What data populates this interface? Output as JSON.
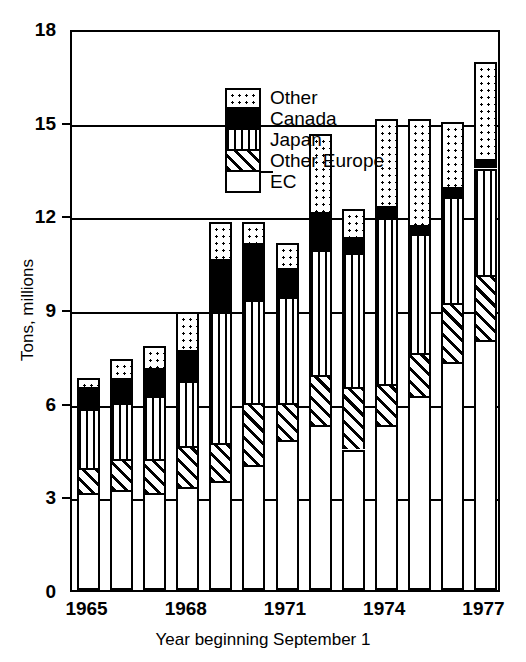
{
  "chart_data": {
    "type": "bar",
    "subtype": "stacked-bar",
    "title": "",
    "xlabel": "Year beginning September 1",
    "ylabel": "Tons, millions",
    "ylim": [
      0,
      18
    ],
    "yticks": [
      0,
      3,
      6,
      9,
      12,
      15,
      18
    ],
    "ytick_labels": [
      "0",
      "3",
      "6",
      "9",
      "12",
      "15",
      "18"
    ],
    "grid": true,
    "grid_axis": "y",
    "legend_position": "upper-left-inside",
    "categories": [
      1965,
      1966,
      1967,
      1968,
      1969,
      1970,
      1971,
      1972,
      1973,
      1974,
      1975,
      1976,
      1977
    ],
    "xtick_labels": [
      "1965",
      "1968",
      "1971",
      "1974",
      "1977"
    ],
    "xtick_categories": [
      1965,
      1968,
      1971,
      1974,
      1977
    ],
    "series": [
      {
        "name": "EC",
        "pattern": "open",
        "values": [
          3.1,
          3.2,
          3.1,
          3.3,
          3.5,
          4.0,
          4.8,
          5.3,
          4.5,
          5.3,
          6.2,
          7.3,
          8.0
        ]
      },
      {
        "name": "Other Europe",
        "pattern": "diagonal-hatch",
        "values": [
          0.8,
          1.0,
          1.1,
          1.3,
          1.2,
          2.0,
          1.2,
          1.6,
          2.0,
          1.3,
          1.4,
          1.9,
          2.1
        ]
      },
      {
        "name": "Japan",
        "pattern": "vertical-stripes",
        "values": [
          1.9,
          1.8,
          2.0,
          2.1,
          4.2,
          3.3,
          3.4,
          4.0,
          4.3,
          5.3,
          3.8,
          3.4,
          3.4
        ]
      },
      {
        "name": "Canada",
        "pattern": "solid-black",
        "values": [
          0.7,
          0.8,
          0.9,
          1.0,
          1.7,
          1.8,
          0.9,
          1.2,
          0.5,
          0.4,
          0.3,
          0.3,
          0.3
        ]
      },
      {
        "name": "Other",
        "pattern": "dotted",
        "values": [
          0.3,
          0.6,
          0.7,
          1.2,
          1.2,
          0.7,
          0.8,
          2.5,
          0.9,
          2.8,
          3.4,
          2.1,
          3.1
        ]
      }
    ],
    "totals": [
      6.8,
      7.4,
      7.8,
      8.9,
      11.8,
      11.8,
      11.1,
      14.6,
      12.2,
      15.1,
      15.1,
      15.0,
      16.9
    ]
  },
  "legend": {
    "items": [
      {
        "label": "Other",
        "swatch": "dotted"
      },
      {
        "label": "Canada",
        "swatch": "solid-black"
      },
      {
        "label": "Japan",
        "swatch": "vertical-stripes"
      },
      {
        "label": "Other Europe",
        "swatch": "diagonal-hatch"
      },
      {
        "label": "EC",
        "swatch": "open"
      }
    ]
  },
  "axes": {
    "y_title": "Tons, millions",
    "x_title": "Year beginning September 1"
  },
  "colors": {
    "ink": "#000000",
    "paper": "#ffffff"
  }
}
